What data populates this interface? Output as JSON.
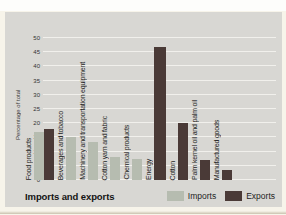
{
  "title": "Imports and exports",
  "palette": {
    "panel_background": "#d8d7d3",
    "gridline": "#f1f0ec",
    "page_background": "#f7f4ea",
    "imports_color": "#b6bcb0",
    "exports_color": "#4a3a37"
  },
  "legend": {
    "imports_label": "Imports",
    "exports_label": "Exports"
  },
  "chart_data": {
    "type": "bar",
    "title": "Imports and exports",
    "xlabel": "",
    "ylabel": "Percentage of total",
    "ylim": [
      0,
      50
    ],
    "yticks": [
      0,
      5,
      10,
      15,
      20,
      25,
      30,
      35,
      40,
      45,
      50
    ],
    "grid": true,
    "legend_position": "bottom-right",
    "categories": [
      "Food products",
      "Beverages and tobacco",
      "Machinery and transportation equipment",
      "Cotton yarn and fabric",
      "Chemical products",
      "Energy",
      "Cotton",
      "Palm kernel oil and palm oil",
      "Manufactured goods"
    ],
    "series": [
      {
        "name": "Imports",
        "color": "#b6bcb0",
        "values": [
          17,
          15,
          13.5,
          8,
          7.5,
          null,
          null,
          null,
          null
        ]
      },
      {
        "name": "Exports",
        "color": "#4a3a37",
        "values": [
          18,
          null,
          null,
          null,
          null,
          47,
          20,
          7,
          3.5
        ]
      }
    ]
  }
}
